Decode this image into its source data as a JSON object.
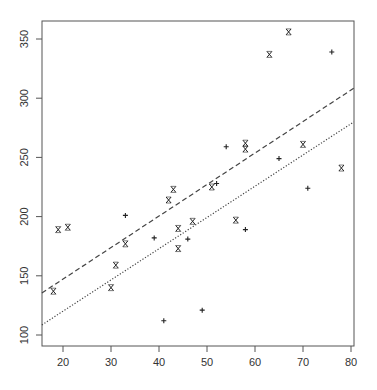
{
  "chart_data": {
    "type": "scatter",
    "title": "",
    "xlabel": "",
    "ylabel": "",
    "xlim": [
      15.6,
      80.6
    ],
    "ylim": [
      90,
      366
    ],
    "grid": false,
    "legend": null,
    "x_ticks": [
      20,
      30,
      40,
      50,
      60,
      70,
      80
    ],
    "y_ticks": [
      100,
      150,
      200,
      250,
      300,
      350
    ],
    "series": [
      {
        "name": "x-marker",
        "marker": "x",
        "points": [
          [
            18,
            137
          ],
          [
            19,
            189
          ],
          [
            21,
            191
          ],
          [
            30,
            140
          ],
          [
            31,
            159
          ],
          [
            33,
            177
          ],
          [
            42,
            214
          ],
          [
            43,
            223
          ],
          [
            44,
            190
          ],
          [
            44,
            173
          ],
          [
            47,
            196
          ],
          [
            51,
            225
          ],
          [
            56,
            197
          ],
          [
            58,
            262
          ],
          [
            58,
            257
          ],
          [
            63,
            337
          ],
          [
            67,
            356
          ],
          [
            70,
            261
          ],
          [
            78,
            241
          ]
        ]
      },
      {
        "name": "plus-marker",
        "marker": "+",
        "points": [
          [
            33,
            201
          ],
          [
            39,
            182
          ],
          [
            41,
            112
          ],
          [
            46,
            181
          ],
          [
            49,
            121
          ],
          [
            52,
            228
          ],
          [
            54,
            259
          ],
          [
            58,
            189
          ],
          [
            65,
            249
          ],
          [
            71,
            224
          ],
          [
            76,
            339
          ]
        ]
      }
    ],
    "lines": [
      {
        "name": "dashed-fit",
        "style": "dashed",
        "from": [
          15.6,
          135.5
        ],
        "to": [
          80.6,
          308.5
        ]
      },
      {
        "name": "dotted-fit",
        "style": "dotted",
        "from": [
          15.6,
          108.5
        ],
        "to": [
          80.6,
          280
        ]
      }
    ]
  },
  "plot": {
    "frame": {
      "left": 42,
      "top": 21,
      "right": 354,
      "bottom": 346
    },
    "colors": {
      "axis": "#555555",
      "marker": "#222222",
      "line": "#444444"
    }
  }
}
